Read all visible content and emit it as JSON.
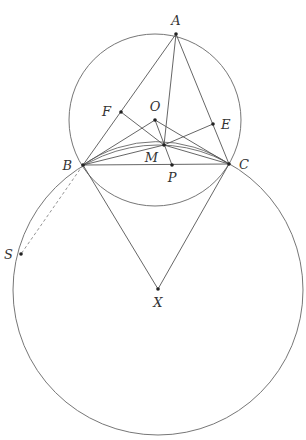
{
  "diagram": {
    "type": "geometry",
    "colors": {
      "line": "#555555",
      "circle": "#666666",
      "dashed": "#888888",
      "point": "#222222",
      "label": "#333333"
    },
    "points": [
      {
        "id": "A",
        "label": "A",
        "x": 176,
        "y": 34,
        "lx": 176,
        "ly": 25,
        "anchor": "middle"
      },
      {
        "id": "B",
        "label": "B",
        "x": 83,
        "y": 165,
        "lx": 72,
        "ly": 170,
        "anchor": "end"
      },
      {
        "id": "C",
        "label": "C",
        "x": 229,
        "y": 164,
        "lx": 239,
        "ly": 169,
        "anchor": "start"
      },
      {
        "id": "F",
        "label": "F",
        "x": 121,
        "y": 112,
        "lx": 111,
        "ly": 116,
        "anchor": "end"
      },
      {
        "id": "O",
        "label": "O",
        "x": 155,
        "y": 120,
        "lx": 155,
        "ly": 111,
        "anchor": "middle"
      },
      {
        "id": "E",
        "label": "E",
        "x": 213,
        "y": 124,
        "lx": 221,
        "ly": 129,
        "anchor": "start"
      },
      {
        "id": "M",
        "label": "M",
        "x": 164,
        "y": 145,
        "lx": 158,
        "ly": 162,
        "anchor": "end"
      },
      {
        "id": "P",
        "label": "P",
        "x": 172,
        "y": 165,
        "lx": 172,
        "ly": 182,
        "anchor": "middle"
      },
      {
        "id": "S",
        "label": "S",
        "x": 21,
        "y": 254,
        "lx": 13,
        "ly": 259,
        "anchor": "end"
      },
      {
        "id": "X",
        "label": "X",
        "x": 158,
        "y": 289,
        "lx": 158,
        "ly": 307,
        "anchor": "middle"
      }
    ],
    "segments": [
      [
        "A",
        "B"
      ],
      [
        "A",
        "C"
      ],
      [
        "A",
        "M"
      ],
      [
        "B",
        "C"
      ],
      [
        "B",
        "O"
      ],
      [
        "B",
        "M"
      ],
      [
        "O",
        "C"
      ],
      [
        "M",
        "C"
      ],
      [
        "F",
        "M"
      ],
      [
        "M",
        "E"
      ],
      [
        "O",
        "P"
      ],
      [
        "B",
        "X"
      ],
      [
        "C",
        "X"
      ]
    ],
    "dashed_segments": [
      [
        "B",
        "S"
      ]
    ],
    "circles": [
      {
        "name": "circumcircle-ABC",
        "cx": 155,
        "cy": 120,
        "r": 86
      },
      {
        "name": "circle-X",
        "cx": 158,
        "cy": 290,
        "r": 145
      }
    ],
    "arcs": [
      {
        "name": "arc-BMC",
        "from": "B",
        "to": "C",
        "through": "M",
        "rx": 128,
        "ry": 128
      }
    ]
  }
}
